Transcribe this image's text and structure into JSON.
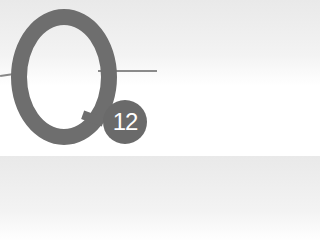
{
  "heading": {
    "letter": "Q",
    "number": "12",
    "colors": {
      "mark": "#6e6e6e",
      "badge": "#6a6a6a",
      "rule": "#8a8a8a",
      "badge_text": "#ffffff"
    }
  }
}
